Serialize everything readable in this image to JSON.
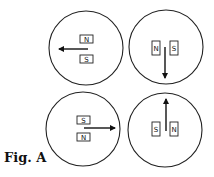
{
  "figure": {
    "caption": "Fig. A",
    "panels": [
      {
        "id": "top-left",
        "cx": 86,
        "cy": 48,
        "r": 37,
        "magnets": [
          {
            "label": "N",
            "x": 80,
            "y": 35,
            "w": 13,
            "h": 8
          },
          {
            "label": "S",
            "x": 80,
            "y": 55,
            "w": 13,
            "h": 8
          }
        ],
        "arrow": {
          "x1": 88,
          "y1": 49,
          "x2": 59,
          "y2": 49,
          "direction": "left"
        }
      },
      {
        "id": "top-right",
        "cx": 166,
        "cy": 47,
        "r": 37,
        "magnets": [
          {
            "label": "N",
            "x": 152,
            "y": 41,
            "w": 8,
            "h": 14
          },
          {
            "label": "S",
            "x": 170,
            "y": 41,
            "w": 8,
            "h": 14
          }
        ],
        "arrow": {
          "x1": 165,
          "y1": 47,
          "x2": 165,
          "y2": 78,
          "direction": "down"
        }
      },
      {
        "id": "bottom-left",
        "cx": 83,
        "cy": 129,
        "r": 37,
        "magnets": [
          {
            "label": "S",
            "x": 77,
            "y": 116,
            "w": 13,
            "h": 8
          },
          {
            "label": "N",
            "x": 77,
            "y": 133,
            "w": 13,
            "h": 8
          }
        ],
        "arrow": {
          "x1": 84,
          "y1": 128,
          "x2": 115,
          "y2": 128,
          "direction": "right"
        }
      },
      {
        "id": "bottom-right",
        "cx": 165,
        "cy": 130,
        "r": 37,
        "magnets": [
          {
            "label": "S",
            "x": 152,
            "y": 122,
            "w": 8,
            "h": 14
          },
          {
            "label": "N",
            "x": 170,
            "y": 122,
            "w": 8,
            "h": 14
          }
        ],
        "arrow": {
          "x1": 166,
          "y1": 131,
          "x2": 166,
          "y2": 99,
          "direction": "up"
        }
      }
    ]
  }
}
